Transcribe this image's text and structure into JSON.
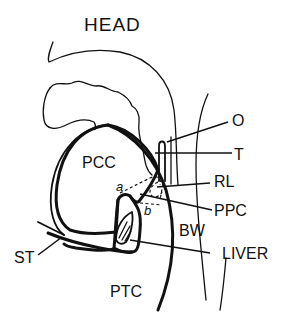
{
  "figure": {
    "title": "HEAD",
    "labels": {
      "pcc": "PCC",
      "ptc": "PTC",
      "bw": "BW",
      "a": "a",
      "b": "b",
      "o": "O",
      "t": "T",
      "rl": "RL",
      "ppc": "PPC",
      "st": "ST",
      "liver": "LIVER"
    },
    "colors": {
      "ink": "#111111",
      "background": "#ffffff"
    }
  }
}
